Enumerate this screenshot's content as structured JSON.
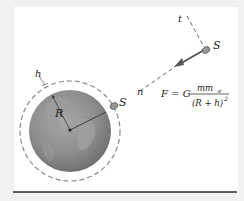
{
  "diagram": {
    "labels": {
      "tangent": "t",
      "normal": "n",
      "satellite": "S",
      "satellite_orbit": "S",
      "altitude": "h",
      "radius": "R"
    },
    "formula": {
      "lhs": "F = G",
      "numerator": "mm",
      "numerator_sub": "e",
      "denominator": "(R + h)",
      "denominator_sup": "2"
    },
    "colors": {
      "earth": "#8f8f8f",
      "orbit": "#8a8a8a",
      "vector": "#555555",
      "rule": "#2a2a2a",
      "background": "#ffffff"
    }
  }
}
